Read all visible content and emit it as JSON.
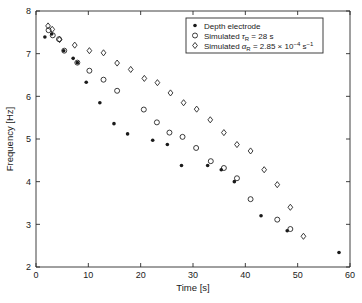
{
  "chart_data": {
    "type": "scatter",
    "title": "",
    "xlabel": "Time [s]",
    "ylabel": "Frequency [Hz]",
    "xlim": [
      0,
      60
    ],
    "ylim": [
      2,
      8
    ],
    "xticks": [
      0,
      10,
      20,
      30,
      40,
      50,
      60
    ],
    "yticks": [
      2,
      3,
      4,
      5,
      6,
      7,
      8
    ],
    "grid": false,
    "legend_position": "top-right",
    "series": [
      {
        "name": "Depth electrode",
        "marker": "filled-circle",
        "points": [
          [
            1.7,
            7.39
          ],
          [
            3.0,
            7.46
          ],
          [
            5.3,
            7.07
          ],
          [
            7.1,
            6.89
          ],
          [
            7.9,
            6.79
          ],
          [
            9.6,
            6.33
          ],
          [
            12.2,
            5.85
          ],
          [
            14.9,
            5.36
          ],
          [
            17.5,
            5.12
          ],
          [
            22.3,
            4.97
          ],
          [
            25.1,
            4.87
          ],
          [
            27.8,
            4.38
          ],
          [
            32.8,
            4.38
          ],
          [
            35.4,
            4.28
          ],
          [
            37.9,
            4.0
          ],
          [
            43.0,
            3.2
          ],
          [
            48.0,
            2.85
          ],
          [
            57.9,
            2.34
          ]
        ]
      },
      {
        "name": "Simulated τR = 28 s",
        "marker": "open-circle",
        "points": [
          [
            2.4,
            7.55
          ],
          [
            3.2,
            7.43
          ],
          [
            4.4,
            7.34
          ],
          [
            5.4,
            7.07
          ],
          [
            7.9,
            6.79
          ],
          [
            10.2,
            6.6
          ],
          [
            12.9,
            6.39
          ],
          [
            15.5,
            6.13
          ],
          [
            20.6,
            5.69
          ],
          [
            23.1,
            5.39
          ],
          [
            25.5,
            5.15
          ],
          [
            28.0,
            5.05
          ],
          [
            30.6,
            4.79
          ],
          [
            33.4,
            4.48
          ],
          [
            35.9,
            4.32
          ],
          [
            38.4,
            4.08
          ],
          [
            41.0,
            3.59
          ],
          [
            46.1,
            3.11
          ],
          [
            48.6,
            2.89
          ]
        ]
      },
      {
        "name": "Simulated αR = 2.85 × 10⁻⁴ s⁻¹",
        "marker": "open-diamond",
        "points": [
          [
            2.3,
            7.65
          ],
          [
            3.1,
            7.57
          ],
          [
            4.5,
            7.33
          ],
          [
            7.4,
            7.2
          ],
          [
            10.2,
            7.07
          ],
          [
            12.9,
            7.02
          ],
          [
            15.5,
            6.78
          ],
          [
            18.1,
            6.63
          ],
          [
            20.7,
            6.42
          ],
          [
            23.2,
            6.32
          ],
          [
            25.7,
            6.08
          ],
          [
            28.2,
            5.85
          ],
          [
            30.7,
            5.7
          ],
          [
            33.3,
            5.45
          ],
          [
            35.9,
            5.15
          ],
          [
            38.4,
            4.87
          ],
          [
            41.0,
            4.72
          ],
          [
            43.6,
            4.28
          ],
          [
            46.1,
            3.93
          ],
          [
            48.6,
            3.4
          ],
          [
            51.1,
            2.72
          ]
        ]
      }
    ]
  },
  "legend": {
    "entries": [
      {
        "label": "Depth electrode",
        "marker": "filled-circle",
        "prefix": "Depth electrode",
        "symbol": "",
        "sub": "",
        "value": "",
        "exp": "",
        "unit": "",
        "unit_exp": ""
      },
      {
        "label": "Simulated τR = 28 s",
        "marker": "open-circle",
        "prefix": "Simulated ",
        "symbol": "τ",
        "sub": "R",
        "value": " = 28 s",
        "exp": "",
        "unit": "",
        "unit_exp": ""
      },
      {
        "label": "Simulated αR = 2.85 × 10⁻⁴ s⁻¹",
        "marker": "open-diamond",
        "prefix": "Simulated ",
        "symbol": "α",
        "sub": "R",
        "value": " = 2.85 × 10",
        "exp": "−4",
        "unit": " s",
        "unit_exp": "−1"
      }
    ]
  },
  "colors": {
    "axis": "#2b2b2b",
    "marker": "#1a1a1a",
    "background": "#ffffff"
  }
}
